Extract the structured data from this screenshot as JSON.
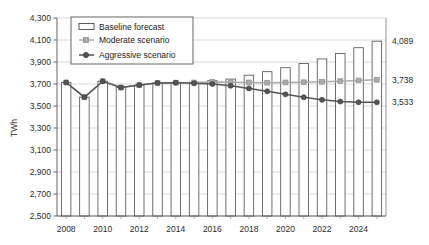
{
  "chart_data": {
    "type": "bar",
    "title": "",
    "subtitle": "",
    "xlabel": "",
    "ylabel": "TWh",
    "ylim": [
      2500,
      4300
    ],
    "ytick_step": 200,
    "yticks": [
      "2,500",
      "2,700",
      "2,900",
      "3,100",
      "3,300",
      "3,500",
      "3,700",
      "3,900",
      "4,100",
      "4,300"
    ],
    "ytick_values": [
      2500,
      2700,
      2900,
      3100,
      3300,
      3500,
      3700,
      3900,
      4100,
      4300
    ],
    "grid": true,
    "legend_position": "top-left",
    "x": [
      2008,
      2009,
      2010,
      2011,
      2012,
      2013,
      2014,
      2015,
      2016,
      2017,
      2018,
      2019,
      2020,
      2021,
      2022,
      2023,
      2024,
      2025
    ],
    "categories": [
      "2008",
      "2009",
      "2010",
      "2011",
      "2012",
      "2013",
      "2014",
      "2015",
      "2016",
      "2017",
      "2018",
      "2019",
      "2020",
      "2021",
      "2022",
      "2023",
      "2024",
      "2025"
    ],
    "xtick_labels": [
      "2008",
      "2010",
      "2012",
      "2014",
      "2016",
      "2018",
      "2020",
      "2022",
      "2024"
    ],
    "xtick_values": [
      2008,
      2010,
      2012,
      2014,
      2016,
      2018,
      2020,
      2022,
      2024
    ],
    "series": [
      {
        "name": "Baseline forecast",
        "type": "bar",
        "color": "#ffffff",
        "edge_color": "#555555",
        "values": [
          3714,
          3580,
          3725,
          3668,
          3690,
          3710,
          3712,
          3716,
          3730,
          3745,
          3780,
          3812,
          3848,
          3886,
          3928,
          3978,
          4030,
          4089
        ],
        "end_label": "4,089"
      },
      {
        "name": "Moderate scenario",
        "type": "line",
        "color": "#aaaaaa",
        "marker": "square",
        "values": [
          3714,
          3580,
          3725,
          3668,
          3690,
          3710,
          3712,
          3714,
          3718,
          3716,
          3714,
          3712,
          3714,
          3716,
          3720,
          3726,
          3732,
          3738
        ],
        "end_label": "3,738"
      },
      {
        "name": "Aggressive scenario",
        "type": "line",
        "color": "#555555",
        "marker": "circle",
        "values": [
          3714,
          3580,
          3725,
          3668,
          3690,
          3710,
          3712,
          3706,
          3700,
          3684,
          3660,
          3634,
          3606,
          3580,
          3556,
          3540,
          3534,
          3533
        ],
        "end_label": "3,533"
      }
    ],
    "end_labels": {
      "baseline": "4,089",
      "moderate": "3,738",
      "aggressive": "3,533"
    }
  },
  "legend": {
    "items": [
      {
        "label": "Baseline forecast",
        "marker": "bar-swatch"
      },
      {
        "label": "Moderate scenario",
        "marker": "line-marker-light"
      },
      {
        "label": "Aggressive scenario",
        "marker": "line-marker-dark"
      }
    ]
  }
}
